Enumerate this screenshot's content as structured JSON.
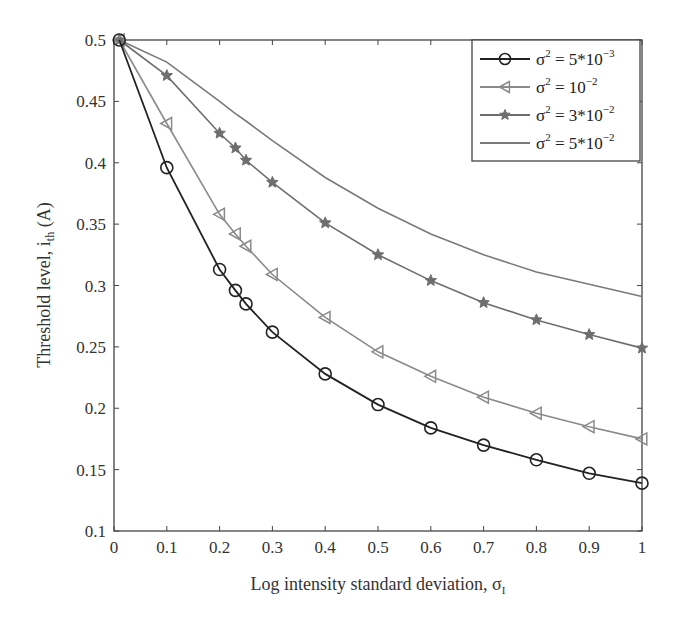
{
  "chart_data": {
    "type": "line",
    "title": "",
    "xlabel": "Log intensity standard deviation, σ",
    "xlabel_subscript": "I",
    "ylabel": "Threshold level, i",
    "ylabel_subscript": "th",
    "ylabel_unit": " (A)",
    "xlim": [
      0,
      1
    ],
    "ylim": [
      0.1,
      0.5
    ],
    "grid": false,
    "legend_position": "upper right",
    "xticks": [
      0,
      0.1,
      0.2,
      0.3,
      0.4,
      0.5,
      0.6,
      0.7,
      0.8,
      0.9,
      1
    ],
    "xtick_labels": [
      "0",
      "0.1",
      "0.2",
      "0.3",
      "0.4",
      "0.5",
      "0.6",
      "0.7",
      "0.8",
      "0.9",
      "1"
    ],
    "yticks": [
      0.1,
      0.15,
      0.2,
      0.25,
      0.3,
      0.35,
      0.4,
      0.45,
      0.5
    ],
    "ytick_labels": [
      "0.1",
      "0.15",
      "0.2",
      "0.25",
      "0.3",
      "0.35",
      "0.4",
      "0.45",
      "0.5"
    ],
    "x": [
      0.01,
      0.1,
      0.2,
      0.23,
      0.25,
      0.3,
      0.4,
      0.5,
      0.6,
      0.7,
      0.8,
      0.9,
      1.0
    ],
    "series": [
      {
        "name": "σ² = 5*10⁻³",
        "legend_base": "σ",
        "legend_sup": "2",
        "legend_eq": " = 5*10",
        "legend_exp": "−3",
        "marker": "circle",
        "color": "#222222",
        "values": [
          0.5,
          0.396,
          0.313,
          0.296,
          0.285,
          0.262,
          0.228,
          0.203,
          0.184,
          0.17,
          0.158,
          0.147,
          0.139
        ]
      },
      {
        "name": "σ² = 10⁻²",
        "legend_base": "σ",
        "legend_sup": "2",
        "legend_eq": " = 10",
        "legend_exp": "−2",
        "marker": "triangle-left",
        "color": "#8a8a8a",
        "values": [
          0.5,
          0.432,
          0.358,
          0.342,
          0.332,
          0.309,
          0.274,
          0.246,
          0.226,
          0.209,
          0.196,
          0.185,
          0.175
        ]
      },
      {
        "name": "σ² = 3*10⁻²",
        "legend_base": "σ",
        "legend_sup": "2",
        "legend_eq": " = 3*10",
        "legend_exp": "−2",
        "marker": "star",
        "color": "#6e6e6e",
        "values": [
          0.5,
          0.471,
          0.424,
          0.412,
          0.402,
          0.384,
          0.351,
          0.325,
          0.304,
          0.286,
          0.272,
          0.26,
          0.249
        ]
      },
      {
        "name": "σ² = 5*10⁻²",
        "legend_base": "σ",
        "legend_sup": "2",
        "legend_eq": " = 5*10",
        "legend_exp": "−2",
        "marker": "none",
        "color": "#7a7a7a",
        "values": [
          0.5,
          0.482,
          0.45,
          0.44,
          0.434,
          0.418,
          0.388,
          0.363,
          0.342,
          0.325,
          0.311,
          0.301,
          0.291
        ]
      }
    ]
  }
}
